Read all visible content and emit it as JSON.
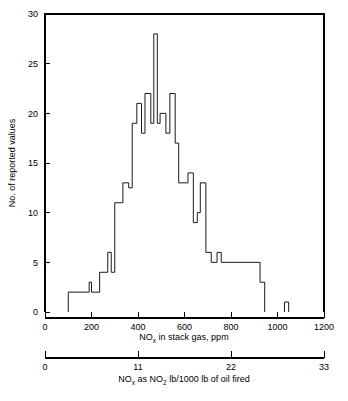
{
  "chart_data": {
    "type": "bar",
    "subtype": "histogram-step",
    "title": "",
    "xlabel": "NOx in stack gas, ppm",
    "ylabel": "No. of reported values",
    "xlim": [
      0,
      1200
    ],
    "ylim": [
      0,
      30
    ],
    "grid": false,
    "legend": null,
    "bin_width": 25,
    "x_ticks": [
      0,
      200,
      400,
      600,
      800,
      1000,
      1200
    ],
    "x_tick_labels": [
      "0",
      "200",
      "400",
      "600",
      "800",
      "1000",
      "1200"
    ],
    "y_ticks": [
      0,
      5,
      10,
      15,
      20,
      25,
      30
    ],
    "y_tick_labels": [
      "0",
      "5",
      "10",
      "15",
      "20",
      "25",
      "30"
    ],
    "bin_starts": [
      100,
      125,
      150,
      175,
      200,
      225,
      250,
      275,
      300,
      325,
      350,
      375,
      400,
      425,
      450,
      475,
      500,
      525,
      550,
      575,
      600,
      625,
      650,
      675,
      700,
      725,
      750,
      775,
      800,
      825,
      850,
      875,
      900,
      925,
      1025
    ],
    "values": [
      2,
      2,
      2,
      2,
      3,
      2,
      4,
      6,
      4,
      11,
      13,
      12.5,
      19,
      21,
      18,
      22,
      19,
      28,
      19,
      20,
      18,
      22,
      17,
      13,
      13,
      14,
      9,
      10,
      13,
      6,
      5.5,
      5,
      5,
      5,
      5,
      3,
      1
    ],
    "bars": [
      {
        "x0": 100,
        "x1": 190,
        "y": 2
      },
      {
        "x0": 190,
        "x1": 200,
        "y": 3
      },
      {
        "x0": 200,
        "x1": 235,
        "y": 2
      },
      {
        "x0": 235,
        "x1": 270,
        "y": 4
      },
      {
        "x0": 270,
        "x1": 285,
        "y": 6
      },
      {
        "x0": 285,
        "x1": 300,
        "y": 4
      },
      {
        "x0": 300,
        "x1": 335,
        "y": 11
      },
      {
        "x0": 335,
        "x1": 360,
        "y": 13
      },
      {
        "x0": 360,
        "x1": 375,
        "y": 12.5
      },
      {
        "x0": 375,
        "x1": 395,
        "y": 19
      },
      {
        "x0": 395,
        "x1": 415,
        "y": 21
      },
      {
        "x0": 415,
        "x1": 430,
        "y": 18
      },
      {
        "x0": 430,
        "x1": 455,
        "y": 22
      },
      {
        "x0": 455,
        "x1": 468,
        "y": 19
      },
      {
        "x0": 468,
        "x1": 483,
        "y": 28
      },
      {
        "x0": 483,
        "x1": 495,
        "y": 19
      },
      {
        "x0": 495,
        "x1": 520,
        "y": 20
      },
      {
        "x0": 520,
        "x1": 537,
        "y": 18
      },
      {
        "x0": 537,
        "x1": 560,
        "y": 22
      },
      {
        "x0": 560,
        "x1": 575,
        "y": 17
      },
      {
        "x0": 575,
        "x1": 615,
        "y": 13
      },
      {
        "x0": 615,
        "x1": 638,
        "y": 14
      },
      {
        "x0": 638,
        "x1": 655,
        "y": 9
      },
      {
        "x0": 655,
        "x1": 668,
        "y": 10
      },
      {
        "x0": 668,
        "x1": 692,
        "y": 13
      },
      {
        "x0": 692,
        "x1": 715,
        "y": 6
      },
      {
        "x0": 715,
        "x1": 740,
        "y": 5
      },
      {
        "x0": 740,
        "x1": 758,
        "y": 6
      },
      {
        "x0": 758,
        "x1": 925,
        "y": 5
      },
      {
        "x0": 925,
        "x1": 945,
        "y": 3
      },
      {
        "x0": 1030,
        "x1": 1048,
        "y": 1
      }
    ],
    "secondary_axis": {
      "label": "NOx as NO2 lb/1000 lb of oil fired",
      "ticks": [
        0,
        11,
        22,
        33
      ],
      "tick_labels": [
        "0",
        "11",
        "22",
        "33"
      ],
      "lim": [
        0,
        33
      ]
    },
    "colors": {
      "line": "#000000",
      "background": "#ffffff",
      "axis": "#000000"
    }
  },
  "labels": {
    "y_axis_title": "No. of reported values",
    "x_axis_title_part1": "NO",
    "x_axis_title_sub": "x",
    "x_axis_title_part2": " in stack gas, ppm",
    "sec_axis_title_part1": "NO",
    "sec_axis_title_sub1": "x",
    "sec_axis_title_part2": " as NO",
    "sec_axis_title_sub2": "2",
    "sec_axis_title_part3": " lb/1000 lb of oil fired"
  }
}
